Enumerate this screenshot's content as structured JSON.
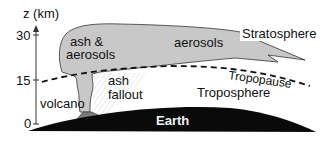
{
  "diagram": {
    "axis": {
      "title": "z (km)",
      "ticks": [
        {
          "label": "30",
          "value": 30
        },
        {
          "label": "15",
          "value": 15
        },
        {
          "label": "0",
          "value": 0
        }
      ]
    },
    "labels": {
      "ash_aerosols_line1": "ash &",
      "ash_aerosols_line2": "aerosols",
      "aerosols": "aerosols",
      "stratosphere": "Stratosphere",
      "tropopause": "Tropopause",
      "troposphere": "Troposphere",
      "ash_fallout_line1": "ash",
      "ash_fallout_line2": "fallout",
      "volcano": "volcano",
      "earth": "Earth"
    },
    "colors": {
      "plume": "#c8c8c8",
      "volcano": "#7a7a7a",
      "earth": "#0a0a0a",
      "fallout_hatch": "#9a9a9a",
      "outline": "#222222"
    }
  }
}
